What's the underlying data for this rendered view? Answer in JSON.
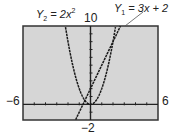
{
  "chart_data": {
    "type": "line",
    "title": "",
    "window": {
      "xmin": -6,
      "xmax": 6,
      "ymin": -2,
      "ymax": 10,
      "xscl": 1,
      "yscl": 1
    },
    "series": [
      {
        "name": "Y1 = 3x + 2",
        "expression": "3x + 2",
        "label_position": "upper-right"
      },
      {
        "name": "Y2 = 2x^2",
        "expression": "2x^2",
        "label_position": "upper-left"
      }
    ],
    "tick_labels": {
      "xmin": "−6",
      "xmax": "6",
      "ymin": "−2",
      "ymax": "10"
    },
    "grid": false,
    "background": "#d6d6d6",
    "frame_color": "#333333",
    "curve_color": "#1a1a1a"
  },
  "labels": {
    "y1": {
      "prefix": "Y",
      "sub": "1",
      "rest": " = 3x + 2"
    },
    "y2": {
      "prefix": "Y",
      "sub": "2",
      "rest": " = 2x",
      "sup": "2"
    },
    "xmin": "−6",
    "xmax": "6",
    "ymin": "−2",
    "ymax": "10"
  }
}
